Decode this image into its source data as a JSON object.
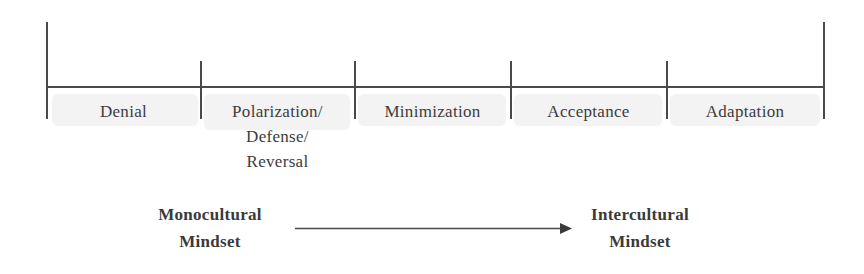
{
  "diagram": {
    "stages": [
      {
        "label": "Denial",
        "lines": [
          "Denial"
        ]
      },
      {
        "label": "Polarization/Defense/Reversal",
        "lines": [
          "Polarization/",
          "Defense/",
          "Reversal"
        ]
      },
      {
        "label": "Minimization",
        "lines": [
          "Minimization"
        ]
      },
      {
        "label": "Acceptance",
        "lines": [
          "Acceptance"
        ]
      },
      {
        "label": "Adaptation",
        "lines": [
          "Adaptation"
        ]
      }
    ],
    "start": {
      "line1": "Monocultural",
      "line2": "Mindset"
    },
    "end": {
      "line1": "Intercultural",
      "line2": "Mindset"
    },
    "colors": {
      "line": "#4a4a4a",
      "text": "#3c3c3c",
      "shade": "#f3f3f3"
    }
  }
}
